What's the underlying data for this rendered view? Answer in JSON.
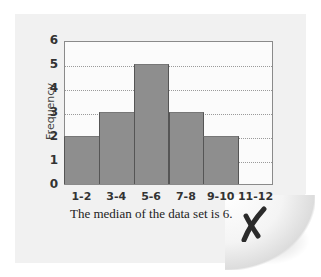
{
  "chart_data": {
    "type": "bar",
    "title": "",
    "xlabel": "",
    "ylabel": "Frequency",
    "categories": [
      "1-2",
      "3-4",
      "5-6",
      "7-8",
      "9-10",
      "11-12"
    ],
    "values": [
      2,
      3,
      5,
      3,
      2,
      0
    ],
    "ylim": [
      0,
      6
    ],
    "yticks": [
      "0",
      "1",
      "2",
      "3",
      "4",
      "5",
      "6"
    ],
    "grid": "horizontal dotted",
    "legend": "none",
    "bar_color": "#8e8e8e"
  },
  "caption": "The median of the data set is 6.",
  "mark": "incorrect-x-mark"
}
